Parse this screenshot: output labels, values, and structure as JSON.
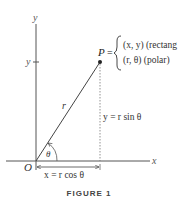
{
  "figure": {
    "caption": "FIGURE 1",
    "axes": {
      "x_label": "x",
      "y_label": "y",
      "origin_label": "O",
      "y_tick_label": "y"
    },
    "point": {
      "label": "P",
      "equals": "=",
      "rectangular": "(x, y) (rectang",
      "polar": "(r, θ) (polar)"
    },
    "segment_label": "r",
    "angle_label": "θ",
    "vertical_label": "y = r sin θ",
    "horizontal_label": "x = r cos θ"
  }
}
